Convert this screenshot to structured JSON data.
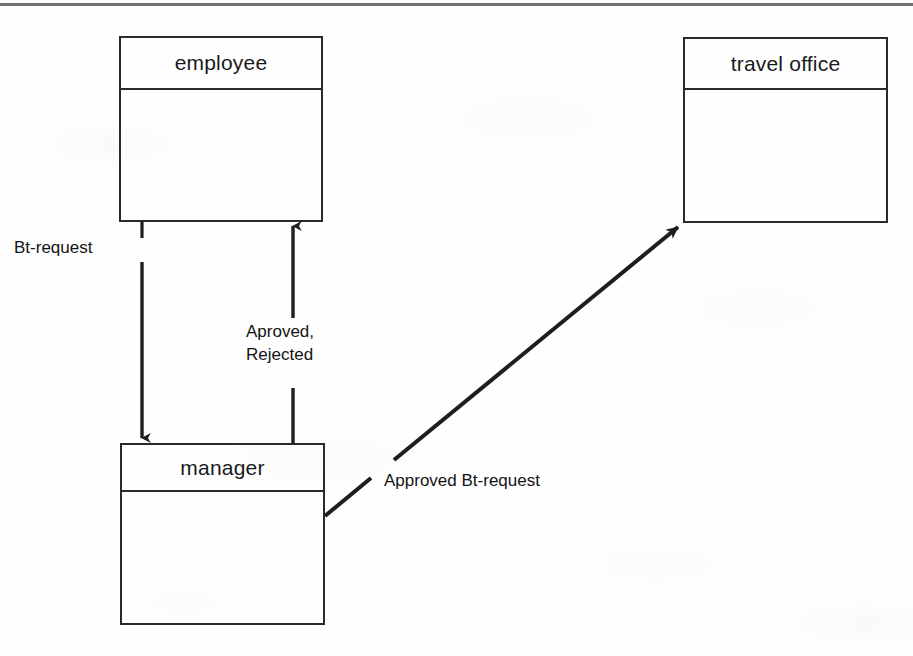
{
  "diagram": {
    "title_rule": true,
    "type": "uml-collaboration-diagram",
    "nodes": [
      {
        "id": "employee",
        "label": "employee",
        "x": 119,
        "y": 36,
        "w": 204,
        "h": 186,
        "header_h": 52
      },
      {
        "id": "travel-office",
        "label": "travel office",
        "x": 683,
        "y": 37,
        "w": 205,
        "h": 186,
        "header_h": 51
      },
      {
        "id": "manager",
        "label": "manager",
        "x": 120,
        "y": 443,
        "w": 205,
        "h": 182,
        "header_h": 47
      }
    ],
    "edges": [
      {
        "id": "employee-to-manager",
        "from": "employee",
        "to": "manager",
        "label": "Bt-request",
        "label_x": 14,
        "label_y": 237,
        "direction": "down"
      },
      {
        "id": "manager-to-employee",
        "from": "manager",
        "to": "employee",
        "label": "Aproved,\nRejected",
        "label_line_1": "Aproved,",
        "label_line_2": "Rejected",
        "label_x": 246,
        "label_y": 321,
        "direction": "up"
      },
      {
        "id": "manager-to-travel-office",
        "from": "manager",
        "to": "travel-office",
        "label": "Approved  Bt-request",
        "label_x": 384,
        "label_y": 470,
        "direction": "diagonal-up-right"
      }
    ],
    "colors": {
      "stroke": "#2a2a2a",
      "text": "#141414",
      "rule": "#6f6f6f",
      "background": "#fefefe"
    }
  }
}
